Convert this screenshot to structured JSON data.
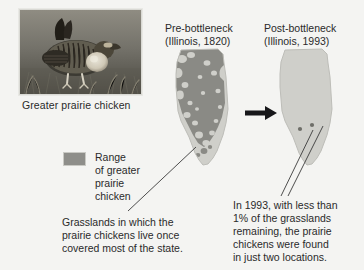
{
  "figure": {
    "background_color": "#f4f4f2",
    "text_color": "#2a2a2a"
  },
  "photo": {
    "alt_name": "greater-prairie-chicken-photo",
    "caption": "Greater prairie chicken"
  },
  "maps": [
    {
      "id": "pre",
      "heading_line1": "Pre-bottleneck",
      "heading_line2": "(Illinois, 1820)",
      "state": "Illinois",
      "year": "1820",
      "range_fill_color": "#8a8a85",
      "state_fill_color": "#cfcfca"
    },
    {
      "id": "post",
      "heading_line1": "Post-bottleneck",
      "heading_line2": "(Illinois, 1993)",
      "state": "Illinois",
      "year": "1993",
      "range_fill_color": "#8a8a85",
      "state_fill_color": "#cfcfca",
      "remaining_locations": 2
    }
  ],
  "arrow": {
    "name": "transition-arrow",
    "direction": "right",
    "color": "#17171a"
  },
  "legend": {
    "swatch_color": "#8e8e8a",
    "line1": "Range",
    "line2": "of greater",
    "line3": "prairie",
    "line4": "chicken"
  },
  "callout_left": {
    "line1": "Grasslands in which the",
    "line2": "prairie chickens live once",
    "line3": "covered most of the state."
  },
  "callout_right": {
    "line1": "In 1993, with less than",
    "line2": "1% of the grasslands",
    "line3": "remaining, the prairie",
    "line4": "chickens were found",
    "line5": "in just two locations."
  }
}
